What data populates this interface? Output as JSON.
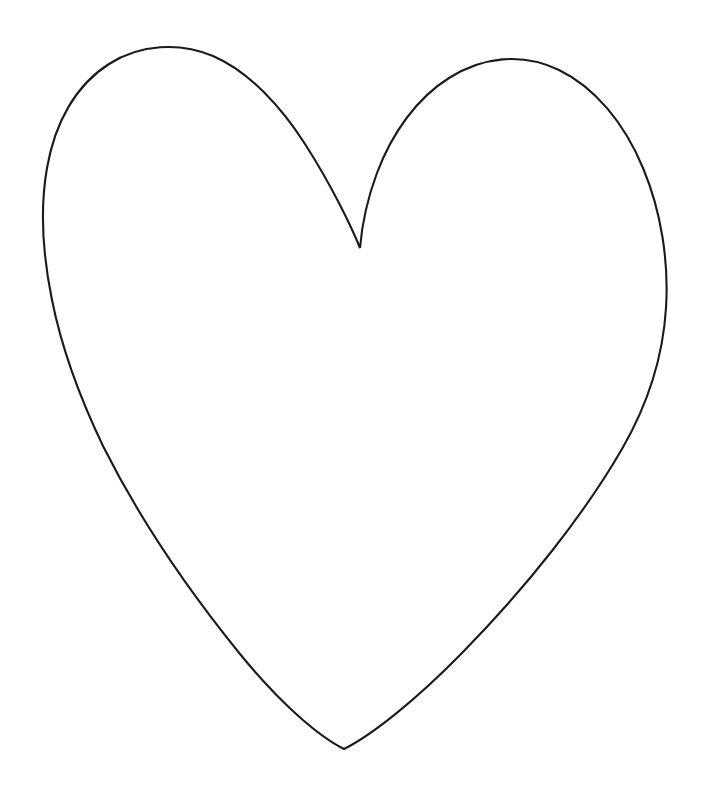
{
  "document": {
    "title": "Heart Outline",
    "type": "line-drawing",
    "description": "Hand-drawn black outline of a heart (valentine) shape on a plain white background",
    "canvas": {
      "width": 713,
      "height": 794,
      "background_color": "#ffffff"
    }
  },
  "drawing": {
    "name": "heart-outline",
    "stroke_color": "#1a1a1a",
    "stroke_width": 2.1,
    "fill": "none",
    "shape_label": "heart",
    "key_points": {
      "top_cleft": [
        360,
        248
      ],
      "bottom_tip": [
        344,
        749
      ],
      "left_lobe_apex": [
        203,
        52
      ],
      "right_lobe_apex": [
        548,
        65
      ],
      "leftmost": [
        45,
        300
      ],
      "rightmost": [
        666,
        245
      ]
    },
    "path": "M 360 248 C 352 228 332 186 305 144 C 282 108 250 72 213 56 C 180 42 140 44 109 64 C 76 85 55 122 47 168 C 40 208 43 256 52 300 C 62 350 80 398 103 446 C 133 506 180 580 240 654 C 280 703 318 736 344 749 C 372 735 416 700 462 653 C 527 587 585 513 622 449 C 648 404 663 357 666 308 C 669 261 661 211 643 168 C 624 122 594 87 559 70 C 522 52 482 57 449 78 C 417 98 392 133 377 173 C 368 197 362 224 360 248 Z"
  },
  "annotations": {
    "has_text": false,
    "has_labels": false,
    "visible_text_items": []
  }
}
